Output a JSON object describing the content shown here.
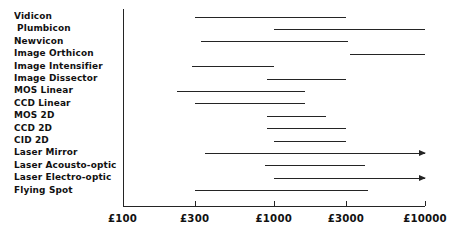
{
  "chart_data": {
    "type": "bar",
    "orientation": "horizontal",
    "subtype": "range-bar",
    "title": "",
    "xlabel": "",
    "ylabel": "",
    "xscale": "log",
    "xlim": [
      100,
      10000
    ],
    "grid": false,
    "legend": null,
    "xticks": [
      {
        "value": 100,
        "label": "£100"
      },
      {
        "value": 300,
        "label": "£300"
      },
      {
        "value": 1000,
        "label": "£1000"
      },
      {
        "value": 3000,
        "label": "£3000"
      },
      {
        "value": 10000,
        "label": "£10000"
      }
    ],
    "categories": [
      "Vidicon",
      "Plumbicon",
      "Newvicon",
      "Image Orthicon",
      "Image Intensifier",
      "Image Dissector",
      "MOS Linear",
      "CCD Linear",
      "MOS 2D",
      "CCD 2D",
      "CID 2D",
      "Laser Mirror",
      "Laser Acousto-optic",
      "Laser Electro-optic",
      "Flying Spot"
    ],
    "ranges": [
      {
        "category": "Vidicon",
        "low": 300,
        "high": 3000,
        "open_ended": false
      },
      {
        "category": "Plumbicon",
        "low": 1000,
        "high": 10000,
        "open_ended": false
      },
      {
        "category": "Newvicon",
        "low": 330,
        "high": 3100,
        "open_ended": false
      },
      {
        "category": "Image Orthicon",
        "low": 3200,
        "high": 10000,
        "open_ended": false
      },
      {
        "category": "Image Intensifier",
        "low": 290,
        "high": 1000,
        "open_ended": false
      },
      {
        "category": "Image Dissector",
        "low": 900,
        "high": 3000,
        "open_ended": false
      },
      {
        "category": "MOS Linear",
        "low": 230,
        "high": 1600,
        "open_ended": false
      },
      {
        "category": "CCD Linear",
        "low": 300,
        "high": 1600,
        "open_ended": false
      },
      {
        "category": "MOS 2D",
        "low": 900,
        "high": 2200,
        "open_ended": false
      },
      {
        "category": "CCD 2D",
        "low": 900,
        "high": 3000,
        "open_ended": false
      },
      {
        "category": "CID 2D",
        "low": 1000,
        "high": 3000,
        "open_ended": false
      },
      {
        "category": "Laser Mirror",
        "low": 350,
        "high": 10000,
        "open_ended": true
      },
      {
        "category": "Laser Acousto-optic",
        "low": 880,
        "high": 4000,
        "open_ended": false
      },
      {
        "category": "Laser Electro-optic",
        "low": 1000,
        "high": 10000,
        "open_ended": true
      },
      {
        "category": "Flying Spot",
        "low": 300,
        "high": 4200,
        "open_ended": false
      }
    ]
  }
}
